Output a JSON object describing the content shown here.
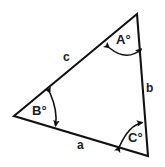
{
  "figure": {
    "type": "triangle-angle-diagram",
    "background_color": "#ffffff",
    "stroke_color": "#111111",
    "text_color": "#1a1a1a"
  },
  "vertices": {
    "top": {
      "name": "vertex-a",
      "x": 137,
      "y": 14
    },
    "left": {
      "name": "vertex-b",
      "x": 14,
      "y": 116
    },
    "bottom_right": {
      "name": "vertex-c",
      "x": 148,
      "y": 156
    }
  },
  "angles": [
    {
      "id": "A",
      "label": "A°",
      "vertex": "top",
      "arc_name": "angle-arc-a"
    },
    {
      "id": "B",
      "label": "B°",
      "vertex": "left",
      "arc_name": "angle-arc-b"
    },
    {
      "id": "C",
      "label": "C°",
      "vertex": "bottom_right",
      "arc_name": "angle-arc-c"
    }
  ],
  "sides": [
    {
      "id": "a",
      "label": "a",
      "between": "left-to-bottom_right",
      "position": "bottom"
    },
    {
      "id": "b",
      "label": "b",
      "between": "top-to-bottom_right",
      "position": "right"
    },
    {
      "id": "c",
      "label": "c",
      "between": "left-to-top",
      "position": "upper-left"
    }
  ]
}
